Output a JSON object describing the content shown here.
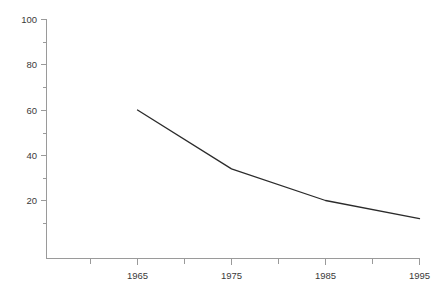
{
  "chart_data": {
    "type": "line",
    "title": "",
    "subtitle": "",
    "xlabel": "",
    "ylabel": "",
    "x": [
      1965,
      1975,
      1985,
      1995
    ],
    "series": [
      {
        "name": "",
        "values": [
          60,
          34,
          20,
          12
        ]
      }
    ],
    "xlim": [
      1960,
      1996
    ],
    "ylim": [
      -6,
      100
    ],
    "y_ticks_major": [
      20,
      40,
      60,
      80,
      100
    ],
    "y_ticks_minor": [
      10,
      30,
      50,
      70,
      90
    ],
    "y_tick_labels": [
      "20",
      "40",
      "60",
      "80",
      "100"
    ],
    "x_ticks_major": [
      1965,
      1975,
      1985,
      1995
    ],
    "x_ticks_minor": [
      1960,
      1970,
      1980,
      1990
    ],
    "x_tick_labels": [
      "1965",
      "1975",
      "1985",
      "1995"
    ],
    "grid": false,
    "legend": false,
    "legend_position": "none",
    "colors": {
      "line": "#2b2b2b",
      "axis": "#9a9a9a",
      "text": "#3a3a3a",
      "background": "#ffffff"
    }
  },
  "axes": {
    "y_labels": [
      {
        "text": "100",
        "value": 100
      },
      {
        "text": "80",
        "value": 80
      },
      {
        "text": "60",
        "value": 60
      },
      {
        "text": "40",
        "value": 40
      },
      {
        "text": "20",
        "value": 20
      }
    ],
    "x_labels": [
      {
        "text": "1965",
        "value": 1965
      },
      {
        "text": "1975",
        "value": 1975
      },
      {
        "text": "1985",
        "value": 1985
      },
      {
        "text": "1995",
        "value": 1995
      }
    ]
  }
}
